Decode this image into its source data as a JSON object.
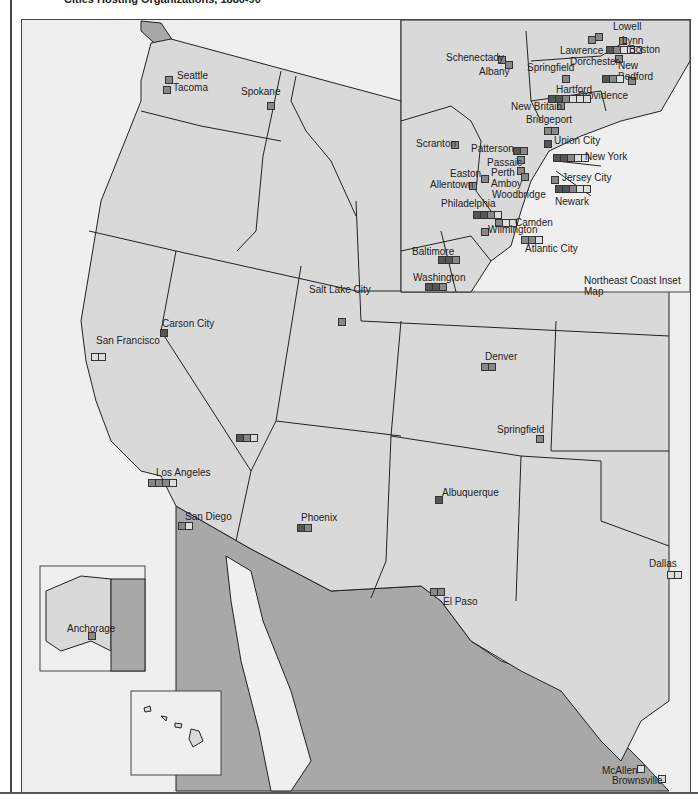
{
  "title": "Cities Hosting Organizations, 1880-90",
  "colors": {
    "land": "#d9d9d9",
    "foreign": "#a8a8a8",
    "water": "#efefef",
    "border": "#222222"
  },
  "inset": {
    "label": "Northeast Coast Inset Map"
  },
  "alaska_inset": {
    "city": "Anchorage"
  },
  "cities_west": [
    {
      "name": "Seattle",
      "x": 164,
      "y": 75,
      "lx": 176,
      "ly": 69,
      "marks": [
        "m"
      ]
    },
    {
      "name": "Tacoma",
      "x": 162,
      "y": 85,
      "lx": 172,
      "ly": 81,
      "marks": [
        "m"
      ]
    },
    {
      "name": "Spokane",
      "x": 266,
      "y": 101,
      "lx": 240,
      "ly": 85,
      "marks": [
        "m"
      ]
    },
    {
      "name": "Carson City",
      "x": 159,
      "y": 328,
      "lx": 161,
      "ly": 317,
      "marks": [
        "d"
      ]
    },
    {
      "name": "San Francisco",
      "x": 90,
      "y": 352,
      "lx": 95,
      "ly": 334,
      "marks": [
        "l",
        "l"
      ]
    },
    {
      "name": "Salt Lake City",
      "x": 337,
      "y": 317,
      "lx": 308,
      "ly": 283,
      "marks": [
        "m"
      ]
    },
    {
      "name": "Las Vegas",
      "x": 235,
      "y": 433,
      "lx": 0,
      "ly": 0,
      "marks": [
        "d",
        "m",
        "l"
      ],
      "hidden_label": true
    },
    {
      "name": "Los Angeles",
      "x": 147,
      "y": 478,
      "lx": 155,
      "ly": 466,
      "marks": [
        "m",
        "m",
        "m",
        "l"
      ]
    },
    {
      "name": "San Diego",
      "x": 177,
      "y": 521,
      "lx": 184,
      "ly": 510,
      "marks": [
        "m",
        "l"
      ]
    },
    {
      "name": "Phoenix",
      "x": 296,
      "y": 523,
      "lx": 300,
      "ly": 511,
      "marks": [
        "d",
        "m"
      ]
    },
    {
      "name": "Denver",
      "x": 480,
      "y": 362,
      "lx": 484,
      "ly": 350,
      "marks": [
        "m",
        "m"
      ]
    },
    {
      "name": "Springfield",
      "x": 535,
      "y": 434,
      "lx": 496,
      "ly": 423,
      "marks": [
        "m"
      ]
    },
    {
      "name": "Albuquerque",
      "x": 434,
      "y": 495,
      "lx": 441,
      "ly": 486,
      "marks": [
        "d"
      ]
    },
    {
      "name": "El Paso",
      "x": 429,
      "y": 587,
      "lx": 442,
      "ly": 595,
      "marks": [
        "m",
        "m"
      ]
    },
    {
      "name": "Dallas",
      "x": 666,
      "y": 570,
      "lx": 648,
      "ly": 557,
      "marks": [
        "l",
        "l"
      ]
    },
    {
      "name": "McAllen",
      "x": 636,
      "y": 764,
      "lx": 601,
      "ly": 764,
      "marks": [
        "l"
      ]
    },
    {
      "name": "Brownsville",
      "x": 657,
      "y": 774,
      "lx": 611,
      "ly": 774,
      "marks": [
        "l"
      ]
    }
  ],
  "cities_ne": [
    {
      "name": "Lowell",
      "x": 594,
      "y": 32,
      "lx": 612,
      "ly": 20,
      "marks": [
        "m"
      ]
    },
    {
      "name": "Lynn",
      "x": 618,
      "y": 36,
      "lx": 621,
      "ly": 34,
      "marks": [
        "m"
      ]
    },
    {
      "name": "Boston",
      "x": 605,
      "y": 45,
      "lx": 628,
      "ly": 43,
      "marks": [
        "d",
        "m",
        "l",
        "l",
        "l"
      ]
    },
    {
      "name": "Lawrence",
      "x": 587,
      "y": 35,
      "lx": 559,
      "ly": 44,
      "marks": [
        "m"
      ]
    },
    {
      "name": "Dorchester",
      "x": 614,
      "y": 54,
      "lx": 569,
      "ly": 55,
      "marks": [
        "m"
      ]
    },
    {
      "name": "New Bedford",
      "x": 627,
      "y": 76,
      "lx": 617,
      "ly": 59,
      "lines": [
        "New",
        "Bedford"
      ],
      "marks": [
        "m"
      ]
    },
    {
      "name": "Schenectady",
      "x": 497,
      "y": 55,
      "lx": 445,
      "ly": 51,
      "marks": [
        "m"
      ]
    },
    {
      "name": "Albany",
      "x": 504,
      "y": 60,
      "lx": 478,
      "ly": 65,
      "marks": [
        "m"
      ]
    },
    {
      "name": "Springfield",
      "x": 561,
      "y": 74,
      "lx": 526,
      "ly": 61,
      "marks": [
        "m"
      ]
    },
    {
      "name": "Providence",
      "x": 601,
      "y": 74,
      "lx": 577,
      "ly": 89,
      "marks": [
        "d",
        "m",
        "l"
      ]
    },
    {
      "name": "Hartford",
      "x": 547,
      "y": 94,
      "lx": 555,
      "ly": 83,
      "marks": [
        "d",
        "d",
        "m",
        "l",
        "l",
        "l"
      ]
    },
    {
      "name": "New Britain",
      "x": 556,
      "y": 101,
      "lx": 510,
      "ly": 100,
      "marks": [
        "m"
      ]
    },
    {
      "name": "Bridgeport",
      "x": 543,
      "y": 126,
      "lx": 525,
      "ly": 113,
      "marks": [
        "m",
        "m"
      ]
    },
    {
      "name": "Union City",
      "x": 543,
      "y": 139,
      "lx": 553,
      "ly": 134,
      "marks": [
        "d"
      ]
    },
    {
      "name": "Scranton",
      "x": 450,
      "y": 140,
      "lx": 415,
      "ly": 137,
      "marks": [
        "m"
      ]
    },
    {
      "name": "Patterson",
      "x": 512,
      "y": 146,
      "lx": 470,
      "ly": 142,
      "marks": [
        "d",
        "m"
      ]
    },
    {
      "name": "Passaic",
      "x": 516,
      "y": 155,
      "lx": 486,
      "ly": 156,
      "marks": [
        "m"
      ]
    },
    {
      "name": "New York",
      "x": 552,
      "y": 153,
      "lx": 584,
      "ly": 150,
      "marks": [
        "d",
        "d",
        "m",
        "l",
        "l"
      ]
    },
    {
      "name": "Easton",
      "x": 480,
      "y": 174,
      "lx": 449,
      "ly": 167,
      "marks": [
        "m"
      ]
    },
    {
      "name": "Perth Amboy",
      "x": 516,
      "y": 166,
      "lx": 490,
      "ly": 166,
      "lines": [
        "Perth",
        "Amboy"
      ],
      "marks": [
        "m"
      ]
    },
    {
      "name": "Allentown",
      "x": 468,
      "y": 181,
      "lx": 429,
      "ly": 178,
      "marks": [
        "m"
      ]
    },
    {
      "name": "Woodbridge",
      "x": 520,
      "y": 172,
      "lx": 491,
      "ly": 188,
      "marks": [
        "m"
      ]
    },
    {
      "name": "Jersey City",
      "x": 550,
      "y": 175,
      "lx": 561,
      "ly": 171,
      "marks": [
        "m"
      ]
    },
    {
      "name": "Newark",
      "x": 554,
      "y": 184,
      "lx": 554,
      "ly": 195,
      "marks": [
        "d",
        "d",
        "m",
        "l",
        "l"
      ]
    },
    {
      "name": "Philadelphia",
      "x": 472,
      "y": 210,
      "lx": 440,
      "ly": 197,
      "marks": [
        "d",
        "d",
        "m",
        "l"
      ]
    },
    {
      "name": "Camden",
      "x": 494,
      "y": 218,
      "lx": 514,
      "ly": 216,
      "marks": [
        "m",
        "l",
        "l"
      ]
    },
    {
      "name": "Wilmington",
      "x": 480,
      "y": 227,
      "lx": 487,
      "ly": 223,
      "marks": [
        "m"
      ]
    },
    {
      "name": "Atlantic City",
      "x": 520,
      "y": 235,
      "lx": 524,
      "ly": 242,
      "marks": [
        "m",
        "m",
        "l"
      ]
    },
    {
      "name": "Baltimore",
      "x": 437,
      "y": 255,
      "lx": 411,
      "ly": 245,
      "marks": [
        "d",
        "d",
        "m"
      ]
    },
    {
      "name": "Washington",
      "x": 424,
      "y": 282,
      "lx": 412,
      "ly": 271,
      "marks": [
        "d",
        "d",
        "m"
      ]
    }
  ]
}
